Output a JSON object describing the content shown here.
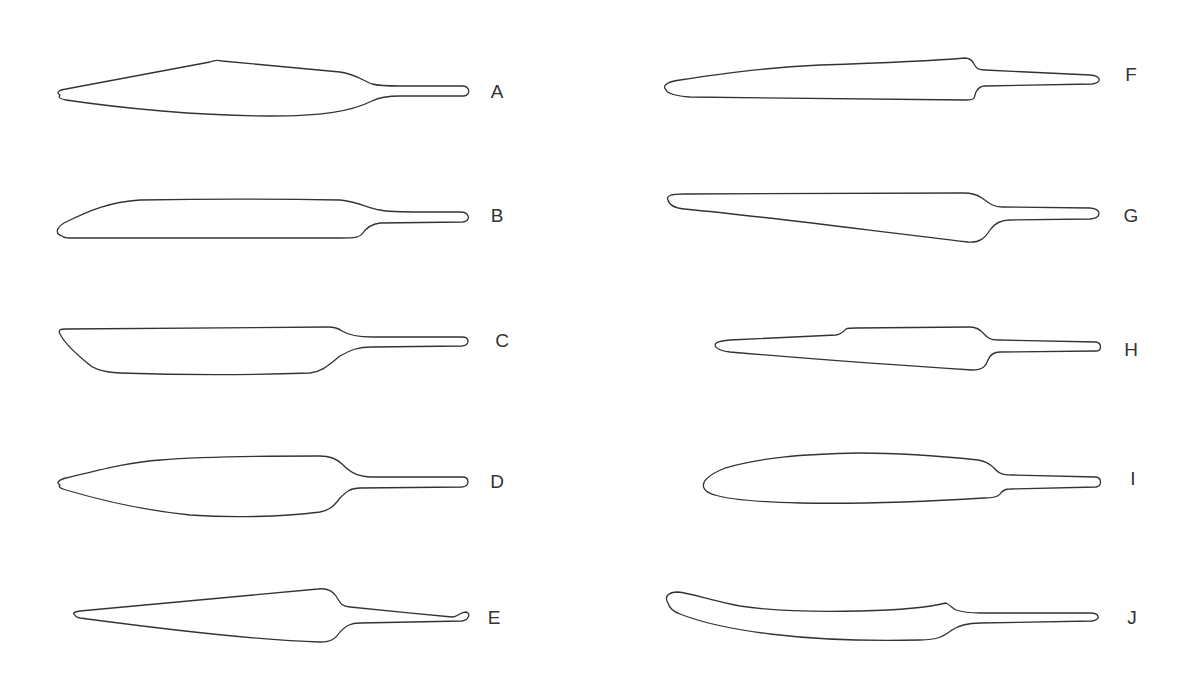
{
  "figure": {
    "type": "blade-outline-comparison",
    "stroke_color": "#333333",
    "background_color": "#ffffff",
    "items": [
      {
        "label": "A",
        "label_x": 497,
        "label_y": 91,
        "path": "M 60 95 C 56 93 58 90 66 89 L 210 62 C 214 60 218 60 222 61 L 340 72 C 355 74 362 80 372 84 C 380 86 388 86 400 86 L 462 86 C 470 86 471 95 464 96 L 400 96 C 388 96 380 97 372 101 C 350 112 320 116 270 116 C 200 116 120 108 66 100 C 60 99 58 97 60 95 Z"
      },
      {
        "label": "B",
        "label_x": 497,
        "label_y": 215,
        "path": "M 62 236 C 55 234 56 228 64 223 C 90 210 110 202 140 200 C 200 199 280 199 340 200 C 358 202 368 208 380 210 C 390 212 400 212 460 212 C 470 212 471 221 463 222 L 380 223 C 372 224 366 228 362 234 C 360 237 356 238 340 238 L 70 238 C 66 238 63 237 62 236 Z"
      },
      {
        "label": "C",
        "label_x": 502,
        "label_y": 340,
        "path": "M 60 334 C 58 330 60 329 66 329 L 328 327 C 334 327 338 328 342 331 C 350 336 360 337 372 337 L 462 337 C 470 337 470 345 462 346 L 372 347 C 358 347 350 350 340 356 C 330 364 322 372 310 373 C 250 375 180 375 120 373 C 100 372 92 368 86 362 C 74 352 64 342 60 334 Z"
      },
      {
        "label": "D",
        "label_x": 497,
        "label_y": 481,
        "path": "M 60 485 C 56 483 58 480 66 478 C 100 470 130 462 160 460 C 210 456 270 456 320 456 C 330 456 336 458 342 464 C 350 472 356 476 370 477 L 462 477 C 470 477 470 486 462 487 L 360 488 C 350 488 346 492 340 498 C 334 506 330 510 320 512 C 280 517 230 518 190 515 C 140 510 100 500 66 490 C 60 488 58 487 60 485 Z"
      },
      {
        "label": "E",
        "label_x": 494,
        "label_y": 617,
        "path": "M 75 615 C 72 613 74 612 80 611 L 318 589 C 326 588 332 590 336 596 C 340 602 340 606 350 607 C 380 610 420 614 452 617 C 458 617 460 612 466 612 C 471 613 469 620 462 621 L 360 623 C 350 623 346 626 340 632 C 336 638 332 642 320 642 C 280 641 200 634 80 618 C 76 617 75 616 75 615 Z"
      },
      {
        "label": "F",
        "label_x": 1131,
        "label_y": 74,
        "path": "M 666 90 C 662 86 666 82 680 80 C 720 74 760 68 820 65 C 880 63 930 61 965 58 C 970 58 972 60 974 64 C 976 68 978 70 985 70 L 1090 75 C 1102 76 1102 83 1092 84 L 985 86 C 980 86 978 88 976 92 L 974 98 C 973 100 970 100 966 100 L 690 97 C 676 96 668 94 666 90 Z"
      },
      {
        "label": "G",
        "label_x": 1131,
        "label_y": 215,
        "path": "M 668 200 C 666 196 670 194 684 194 L 964 193 C 972 193 976 194 982 198 C 990 204 994 207 1002 207 L 1090 208 C 1102 209 1102 218 1090 219 L 1010 220 C 1000 220 994 224 990 230 C 985 238 980 243 968 242 C 880 232 780 218 684 209 C 674 208 669 204 668 200 Z"
      },
      {
        "label": "H",
        "label_x": 1131,
        "label_y": 349,
        "path": "M 716 347 C 713 343 718 341 730 340 L 836 335 C 842 334 844 331 846 329 C 848 328 850 328 856 328 L 970 327 C 976 327 980 329 984 334 C 988 338 990 340 998 340 L 1096 342 C 1102 343 1102 351 1096 351 L 1000 352 C 994 352 990 355 988 360 C 986 366 983 370 972 370 C 890 365 800 358 730 352 C 722 351 718 350 716 347 Z"
      },
      {
        "label": "I",
        "label_x": 1133,
        "label_y": 478,
        "path": "M 704 488 C 701 482 708 475 725 468 C 760 458 800 454 860 453 C 900 453 940 456 978 460 C 986 461 990 464 994 468 C 998 473 1002 475 1012 475 L 1096 477 C 1102 478 1102 486 1096 487 L 1010 489 C 1004 489 1002 491 1000 494 C 998 497 994 498 984 498 C 920 502 860 504 800 503 C 760 502 730 500 715 495 C 708 493 705 491 704 488 Z"
      },
      {
        "label": "J",
        "label_x": 1132,
        "label_y": 617,
        "path": "M 668 603 C 664 597 668 592 678 592 C 690 593 710 600 740 606 C 780 612 820 612 860 611 C 900 610 930 607 946 603 C 950 605 952 608 956 610 C 962 612 968 613 980 613 L 1090 613 C 1100 613 1101 620 1092 621 L 980 623 C 966 623 958 626 952 630 C 944 636 938 640 920 640 C 880 641 820 640 770 634 C 730 629 700 622 680 614 C 672 611 669 607 668 603 Z"
      }
    ]
  }
}
